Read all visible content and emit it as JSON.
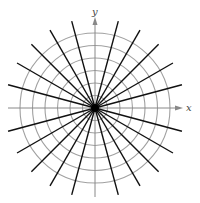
{
  "diagram": {
    "type": "polar-grid",
    "center": {
      "x": 95,
      "y": 108
    },
    "circles": {
      "count": 6,
      "spacing": 12.5,
      "color": "#a0a0a0"
    },
    "rays": {
      "step_deg": 15,
      "skip_axes": true,
      "length": 90,
      "color": "#111111"
    },
    "axes": {
      "color": "#888888",
      "x_label": "x",
      "y_label": "y"
    }
  }
}
